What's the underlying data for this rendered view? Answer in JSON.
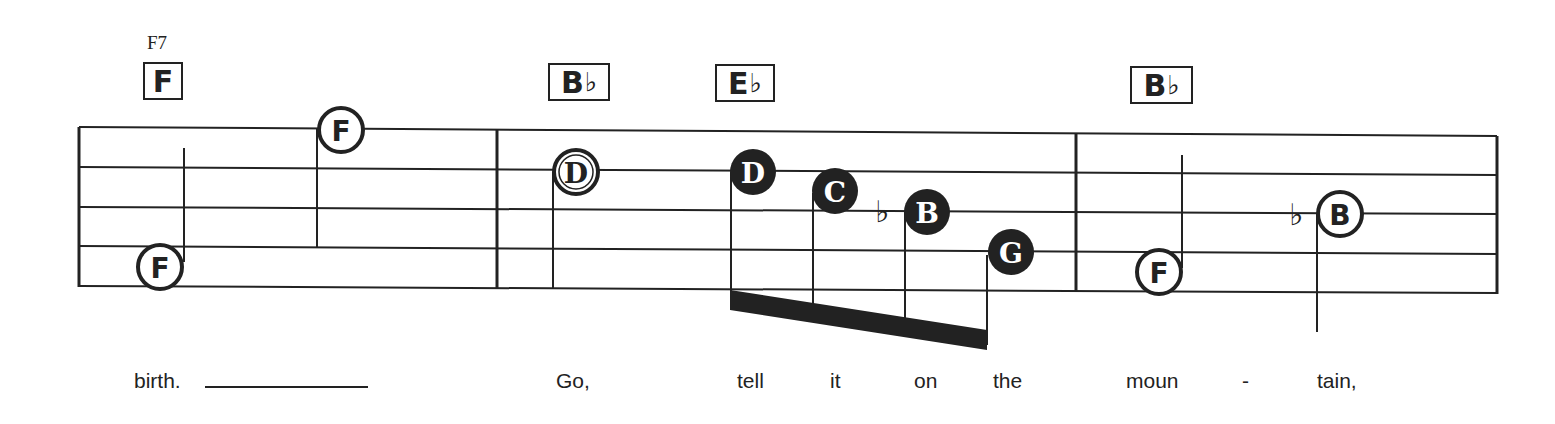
{
  "score": {
    "chord_symbol_small": "F7",
    "chords": [
      {
        "root": "F",
        "accidental": "",
        "x": 143,
        "w": 40
      },
      {
        "root": "B",
        "accidental": "♭",
        "x": 548,
        "w": 62
      },
      {
        "root": "E",
        "accidental": "♭",
        "x": 715,
        "w": 60
      },
      {
        "root": "B",
        "accidental": "♭",
        "x": 1130,
        "w": 63
      }
    ],
    "notes": [
      {
        "letter": "F",
        "style": "open",
        "measure": 1
      },
      {
        "letter": "F",
        "style": "open",
        "measure": 1
      },
      {
        "letter": "D",
        "style": "open",
        "measure": 2
      },
      {
        "letter": "D",
        "style": "filled",
        "measure": 2
      },
      {
        "letter": "C",
        "style": "filled",
        "measure": 2
      },
      {
        "letter": "B",
        "style": "filled",
        "accidental": "♭",
        "measure": 2
      },
      {
        "letter": "G",
        "style": "filled",
        "measure": 2
      },
      {
        "letter": "F",
        "style": "open",
        "measure": 3
      },
      {
        "letter": "B",
        "style": "open",
        "accidental": "♭",
        "measure": 3
      }
    ],
    "lyrics": [
      {
        "text": "birth.",
        "x": 134
      },
      {
        "text": "Go,",
        "x": 556
      },
      {
        "text": "tell",
        "x": 737
      },
      {
        "text": "it",
        "x": 830
      },
      {
        "text": "on",
        "x": 914
      },
      {
        "text": "the",
        "x": 993
      },
      {
        "text": "moun",
        "x": 1126
      },
      {
        "text": "-",
        "x": 1242
      },
      {
        "text": "tain,",
        "x": 1317
      }
    ]
  }
}
